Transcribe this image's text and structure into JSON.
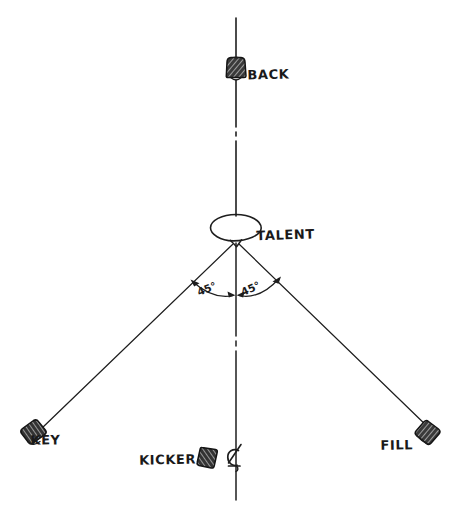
{
  "diagram": {
    "background_color": "#ffffff",
    "ink_color": "#1e1e1e",
    "centerline_style": "dash-dot",
    "labels": {
      "back": "BACK",
      "talent": "TALENT",
      "key": "KEY",
      "fill": "FILL",
      "kicker": "KICKER"
    },
    "angles": {
      "left": "45°",
      "right": "45°"
    },
    "icons": {
      "back_light": "lamp-fixture-icon",
      "key_light": "lamp-fixture-icon",
      "fill_light": "lamp-fixture-icon",
      "kicker_light": "lamp-fixture-icon",
      "camera": "camera-icon",
      "talent_head": "talent-head-icon",
      "centerline": "centerline-icon"
    },
    "elements": {
      "back_position": "top-center",
      "talent_position": "center",
      "key_position": "bottom-left",
      "fill_position": "bottom-right",
      "kicker_position": "bottom-center",
      "camera_position": "bottom-center-on-axis"
    }
  }
}
